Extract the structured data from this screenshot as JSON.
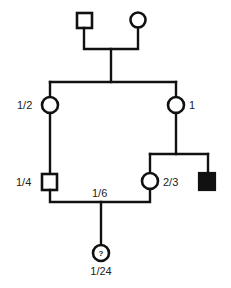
{
  "diagram": {
    "type": "pedigree",
    "colors": {
      "line": "#111111",
      "affected_fill": "#111111",
      "unaffected_fill": "#ffffff",
      "background": "#ffffff"
    },
    "generation_1": {
      "male": {
        "shape": "square",
        "affected": false,
        "label": ""
      },
      "female": {
        "shape": "circle",
        "affected": false,
        "label": ""
      }
    },
    "generation_2": {
      "left_female": {
        "shape": "circle",
        "affected": false,
        "label": "1/2"
      },
      "right_female": {
        "shape": "circle",
        "affected": false,
        "label": "1"
      }
    },
    "generation_3": {
      "left_male": {
        "shape": "square",
        "affected": false,
        "label": "1/4"
      },
      "middle_female": {
        "shape": "circle",
        "affected": false,
        "label": "2/3"
      },
      "right_male": {
        "shape": "square",
        "affected": true,
        "label": ""
      }
    },
    "mating_line": {
      "label": "1/6"
    },
    "generation_4": {
      "proband": {
        "shape": "circle",
        "affected": "unknown",
        "symbol": "?",
        "label": "1/24"
      }
    }
  }
}
